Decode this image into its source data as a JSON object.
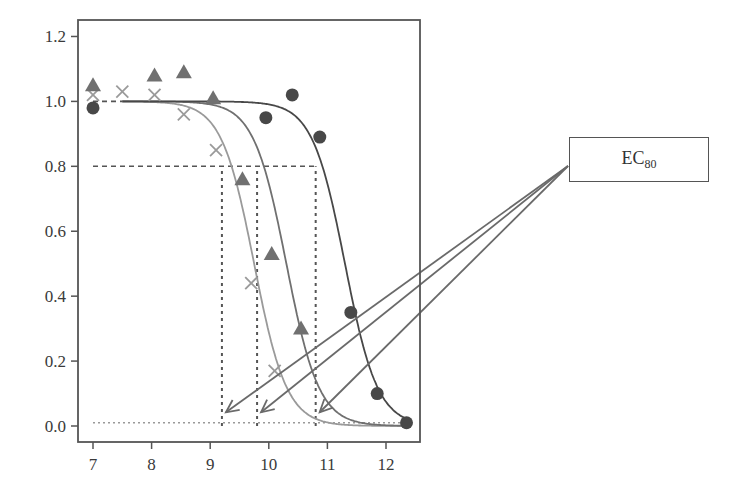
{
  "chart_data": {
    "type": "scatter",
    "title": "",
    "xlabel": "",
    "ylabel": "",
    "xlim": [
      6.75,
      12.6
    ],
    "ylim": [
      -0.05,
      1.25
    ],
    "x_ticks": [
      7,
      8,
      9,
      10,
      11,
      12
    ],
    "y_ticks": [
      0.0,
      0.2,
      0.4,
      0.6,
      0.8,
      1.0,
      1.2
    ],
    "y_tick_labels": [
      "0.0",
      "0.2",
      "0.4",
      "0.6",
      "0.8",
      "1.0",
      "1.2"
    ],
    "x_tick_labels": [
      "7",
      "8",
      "9",
      "10",
      "11",
      "12"
    ],
    "grid": false,
    "legend": null,
    "series": [
      {
        "name": "crosses",
        "marker": "x",
        "color": "#9a9a9a",
        "points": [
          [
            7.0,
            1.02
          ],
          [
            7.5,
            1.03
          ],
          [
            8.05,
            1.02
          ],
          [
            8.55,
            0.96
          ],
          [
            9.1,
            0.85
          ],
          [
            9.7,
            0.44
          ],
          [
            10.1,
            0.17
          ]
        ],
        "fit_curve": {
          "top": 1.0,
          "bottom": 0.0,
          "ec50": 9.75,
          "hill": 3.6,
          "x_start": 7.5,
          "x_end": 12.3
        },
        "ec80": 9.2
      },
      {
        "name": "triangles",
        "marker": "triangle",
        "color": "#707070",
        "points": [
          [
            7.0,
            1.05
          ],
          [
            8.05,
            1.08
          ],
          [
            8.55,
            1.09
          ],
          [
            9.05,
            1.01
          ],
          [
            9.55,
            0.76
          ],
          [
            10.05,
            0.53
          ],
          [
            10.55,
            0.3
          ]
        ],
        "fit_curve": {
          "top": 1.0,
          "bottom": 0.0,
          "ec50": 10.3,
          "hill": 3.6,
          "x_start": 7.5,
          "x_end": 12.3
        },
        "ec80": 9.8
      },
      {
        "name": "circles",
        "marker": "circle",
        "color": "#484848",
        "points": [
          [
            7.0,
            0.98
          ],
          [
            9.95,
            0.95
          ],
          [
            10.4,
            1.02
          ],
          [
            10.87,
            0.89
          ],
          [
            11.4,
            0.35
          ],
          [
            11.85,
            0.1
          ],
          [
            12.35,
            0.01
          ]
        ],
        "fit_curve": {
          "top": 1.0,
          "bottom": 0.0,
          "ec50": 11.3,
          "hill": 3.6,
          "x_start": 7.5,
          "x_end": 12.4
        },
        "ec80": 10.8
      }
    ],
    "reference_lines": [
      {
        "type": "horizontal",
        "y": 1.0,
        "style": "dashed",
        "x_range": [
          7.0,
          7.5
        ]
      },
      {
        "type": "horizontal",
        "y": 0.8,
        "style": "dashed",
        "x_range": [
          7.0,
          10.8
        ]
      },
      {
        "type": "horizontal",
        "y": 0.01,
        "style": "dotted",
        "x_range": [
          7.0,
          12.3
        ]
      },
      {
        "type": "vertical",
        "x": 9.2,
        "style": "dashed",
        "y_range": [
          0.0,
          0.8
        ]
      },
      {
        "type": "vertical",
        "x": 9.8,
        "style": "dashed",
        "y_range": [
          0.0,
          0.8
        ]
      },
      {
        "type": "vertical",
        "x": 10.8,
        "style": "dashed",
        "y_range": [
          0.0,
          0.8
        ]
      }
    ],
    "annotations": [
      {
        "text": "EC80",
        "label_main": "EC",
        "label_sub": "80",
        "arrows_to": [
          [
            9.2,
            0.03
          ],
          [
            9.8,
            0.03
          ],
          [
            10.8,
            0.03
          ]
        ]
      }
    ]
  },
  "annotation": {
    "label_main": "EC",
    "label_sub": "80"
  },
  "colors": {
    "axis": "#555555",
    "text": "#3a3a3a",
    "arrow": "#6a6a6a"
  }
}
